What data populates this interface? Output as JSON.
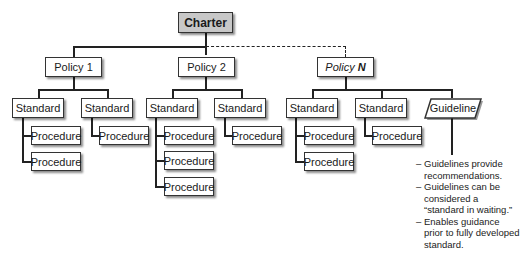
{
  "diagram": {
    "root": {
      "label": "Charter",
      "fill": "#c8c8c8"
    },
    "policies": [
      {
        "label": "Policy 1",
        "standards": [
          {
            "label": "Standard",
            "procedures": [
              "Procedure",
              "Procedure"
            ]
          },
          {
            "label": "Standard",
            "procedures": [
              "Procedure"
            ]
          }
        ]
      },
      {
        "label": "Policy 2",
        "standards": [
          {
            "label": "Standard",
            "procedures": [
              "Procedure",
              "Procedure",
              "Procedure"
            ]
          },
          {
            "label": "Standard",
            "procedures": [
              "Procedure"
            ]
          }
        ]
      },
      {
        "label_prefix": "Policy",
        "label_suffix": "N",
        "connector": "dashed",
        "standards": [
          {
            "label": "Standard",
            "procedures": [
              "Procedure",
              "Procedure"
            ]
          },
          {
            "label": "Standard",
            "procedures": [
              "Procedure"
            ]
          }
        ],
        "guideline": {
          "label": "Guideline",
          "notes": [
            "Guidelines provide recommendations.",
            "Guidelines can be considered a “standard in waiting.”",
            "Enables guidance prior to fully developed standard."
          ]
        }
      }
    ],
    "note_bullet": "–"
  }
}
